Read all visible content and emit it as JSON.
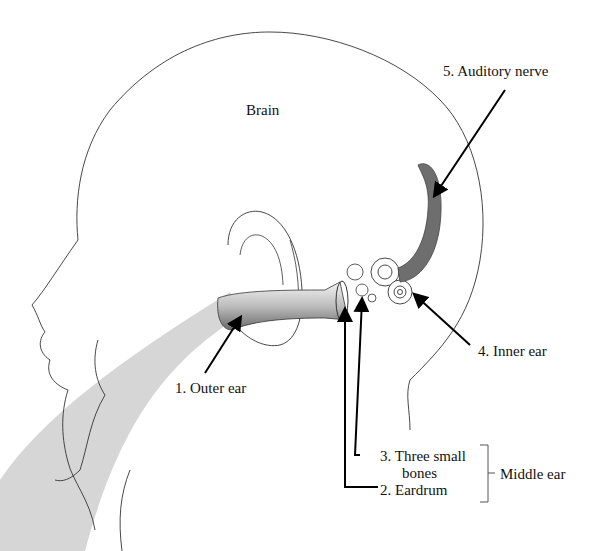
{
  "diagram": {
    "labels": {
      "brain": "Brain",
      "auditory_nerve": "5. Auditory nerve",
      "inner_ear": "4. Inner ear",
      "outer_ear": "1. Outer ear",
      "three_small_bones_line1": "3. Three small",
      "three_small_bones_line2": "bones",
      "eardrum": "2. Eardrum",
      "middle_ear": "Middle ear"
    },
    "colors": {
      "outline": "#333333",
      "sound_wave": "#d4d4d4",
      "nerve": "#6e6e6e",
      "arrow": "#000000"
    }
  }
}
